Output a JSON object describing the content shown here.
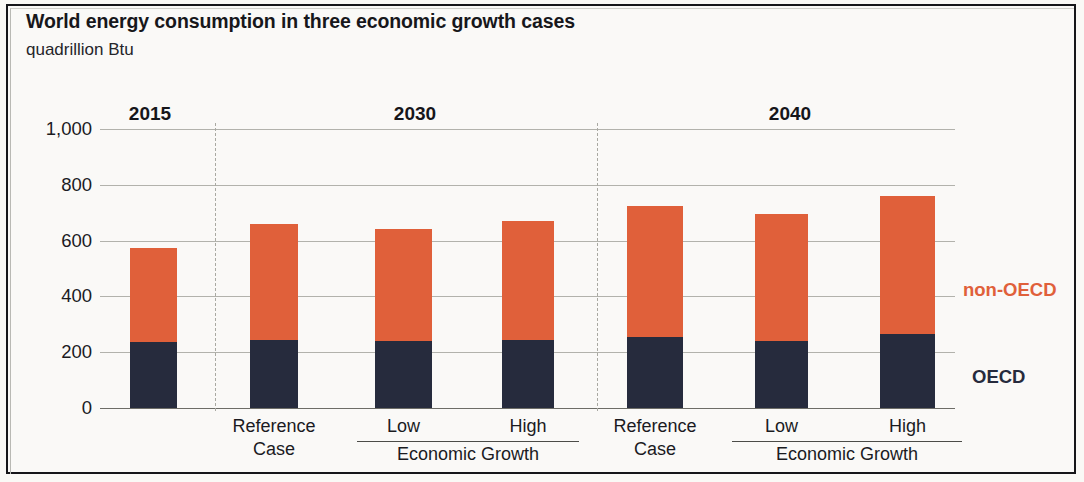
{
  "figure": {
    "title": "World energy consumption in three economic growth cases",
    "subtitle": "quadrillion Btu"
  },
  "legend": {
    "non_oecd": "non-OECD",
    "oecd": "OECD"
  },
  "axis": {
    "yticks": [
      "1,000",
      "800",
      "600",
      "400",
      "200",
      "0"
    ]
  },
  "groups": [
    {
      "year": "2015",
      "bracket_label": ""
    },
    {
      "year": "2030",
      "bracket_label": "Economic Growth"
    },
    {
      "year": "2040",
      "bracket_label": "Economic Growth"
    }
  ],
  "bars": [
    {
      "line1": "",
      "line2": "",
      "year": "2015"
    },
    {
      "line1": "Reference",
      "line2": "Case",
      "year": "2030"
    },
    {
      "line1": "Low",
      "line2": "",
      "year": "2030"
    },
    {
      "line1": "High",
      "line2": "",
      "year": "2030"
    },
    {
      "line1": "Reference",
      "line2": "Case",
      "year": "2040"
    },
    {
      "line1": "Low",
      "line2": "",
      "year": "2040"
    },
    {
      "line1": "High",
      "line2": "",
      "year": "2040"
    }
  ],
  "colors": {
    "non_oecd": "#e0603a",
    "oecd": "#262b3d",
    "grid": "#9a9a93",
    "text": "#16161a"
  },
  "chart_data": {
    "type": "bar",
    "title": "World energy consumption in three economic growth cases",
    "subtitle": "quadrillion Btu",
    "xlabel": "",
    "ylabel": "quadrillion Btu",
    "ylim": [
      0,
      1000
    ],
    "yticks": [
      0,
      200,
      400,
      600,
      800,
      1000
    ],
    "grid": true,
    "stacked": true,
    "legend_position": "right",
    "categories": [
      "2015",
      "2030 Reference Case",
      "2030 Low Economic Growth",
      "2030 High Economic Growth",
      "2040 Reference Case",
      "2040 Low Economic Growth",
      "2040 High Economic Growth"
    ],
    "series": [
      {
        "name": "OECD",
        "color": "#262b3d",
        "values": [
          235,
          245,
          240,
          245,
          255,
          240,
          265
        ]
      },
      {
        "name": "non-OECD",
        "color": "#e0603a",
        "values": [
          340,
          415,
          400,
          425,
          470,
          455,
          495
        ]
      }
    ],
    "totals": [
      575,
      660,
      640,
      670,
      725,
      695,
      760
    ],
    "group_brackets": [
      {
        "year": "2030",
        "label": "Economic Growth",
        "members": [
          "Low",
          "High"
        ]
      },
      {
        "year": "2040",
        "label": "Economic Growth",
        "members": [
          "Low",
          "High"
        ]
      }
    ]
  },
  "geometry": {
    "bar_x": [
      130,
      250,
      375,
      502,
      627,
      755,
      880
    ],
    "bar_width": [
      47,
      48,
      57,
      52,
      56,
      53,
      55
    ],
    "divider_x": [
      215,
      597
    ],
    "year_x": [
      150,
      415,
      790
    ],
    "bracket": [
      {
        "left": 357,
        "width": 222,
        "center_x": 468
      },
      {
        "left": 732,
        "width": 230,
        "center_x": 847
      }
    ],
    "legend_nonoecd": {
      "left": 963,
      "top": 279
    },
    "legend_oecd": {
      "left": 972,
      "top": 366
    }
  }
}
